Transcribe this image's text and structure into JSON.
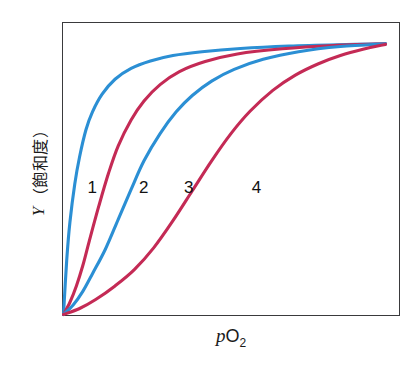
{
  "figure": {
    "background_color": "#ffffff",
    "frame_color": "#3a3a3c"
  },
  "axes": {
    "ylabel_symbol": "Y",
    "ylabel_text": "（飽和度）",
    "xlabel_symbol": "p",
    "xlabel_main": "O",
    "xlabel_sub": "2"
  },
  "labels": {
    "one": "1",
    "two": "2",
    "three": "3",
    "four": "4"
  },
  "chart_data": {
    "type": "line",
    "title": "",
    "subtitle": "",
    "xlabel": "pO2",
    "ylabel": "Y (飽和度)",
    "xlim": [
      0,
      1
    ],
    "ylim": [
      0,
      1
    ],
    "grid": false,
    "legend": "inline curve numbers",
    "axis_ticks": "none",
    "annotations": [
      "1",
      "2",
      "3",
      "4"
    ],
    "series": [
      {
        "name": "1",
        "color": "#2b8fd4",
        "shape": "hyperbolic",
        "label_position": {
          "x": 0.09,
          "y": 0.46
        },
        "x": [
          0.0,
          0.01,
          0.02,
          0.035,
          0.05,
          0.07,
          0.09,
          0.12,
          0.16,
          0.21,
          0.27,
          0.34,
          0.43,
          0.55,
          0.7,
          0.85,
          1.0
        ],
        "y": [
          0.0,
          0.2,
          0.34,
          0.48,
          0.58,
          0.68,
          0.745,
          0.81,
          0.865,
          0.905,
          0.932,
          0.952,
          0.966,
          0.978,
          0.987,
          0.992,
          0.995
        ]
      },
      {
        "name": "2",
        "color": "#c42a55",
        "shape": "sigmoidal",
        "label_position": {
          "x": 0.25,
          "y": 0.46
        },
        "x": [
          0.0,
          0.02,
          0.04,
          0.06,
          0.08,
          0.11,
          0.14,
          0.17,
          0.21,
          0.25,
          0.3,
          0.36,
          0.44,
          0.54,
          0.68,
          0.84,
          1.0
        ],
        "y": [
          0.0,
          0.045,
          0.105,
          0.18,
          0.27,
          0.4,
          0.52,
          0.62,
          0.715,
          0.785,
          0.845,
          0.893,
          0.93,
          0.958,
          0.977,
          0.989,
          0.995
        ]
      },
      {
        "name": "3",
        "color": "#2b8fd4",
        "shape": "sigmoidal",
        "label_position": {
          "x": 0.39,
          "y": 0.46
        },
        "x": [
          0.0,
          0.03,
          0.06,
          0.09,
          0.13,
          0.17,
          0.21,
          0.25,
          0.3,
          0.35,
          0.4,
          0.46,
          0.53,
          0.62,
          0.73,
          0.86,
          1.0
        ],
        "y": [
          0.0,
          0.035,
          0.085,
          0.15,
          0.24,
          0.35,
          0.46,
          0.565,
          0.665,
          0.745,
          0.805,
          0.858,
          0.901,
          0.938,
          0.966,
          0.985,
          0.995
        ]
      },
      {
        "name": "4",
        "color": "#c42a55",
        "shape": "sigmoidal",
        "label_position": {
          "x": 0.6,
          "y": 0.46
        },
        "x": [
          0.0,
          0.05,
          0.1,
          0.16,
          0.22,
          0.28,
          0.34,
          0.4,
          0.46,
          0.52,
          0.58,
          0.65,
          0.72,
          0.79,
          0.86,
          0.93,
          1.0
        ],
        "y": [
          0.0,
          0.022,
          0.055,
          0.105,
          0.165,
          0.245,
          0.345,
          0.455,
          0.565,
          0.665,
          0.748,
          0.824,
          0.88,
          0.921,
          0.952,
          0.975,
          0.993
        ]
      }
    ]
  }
}
